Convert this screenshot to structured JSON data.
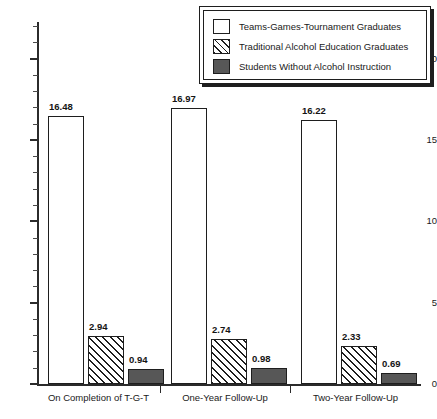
{
  "chart_data": {
    "type": "bar",
    "title": "",
    "subtitle": "",
    "xlabel": "",
    "ylabel": "",
    "ylim": [
      0,
      22
    ],
    "y_major_ticks": [
      0,
      5,
      10,
      15,
      20
    ],
    "y_tick_labels": [
      "0",
      "5",
      "10",
      "15",
      "20"
    ],
    "y_minor_tick_step": 1,
    "grid": false,
    "legend_position": "top-right",
    "categories": [
      "On Completion of T-G-T",
      "One-Year Follow-Up",
      "Two-Year Follow-Up"
    ],
    "series": [
      {
        "name": "Teams-Games-Tournament Graduates",
        "fill": "white",
        "color": "#ffffff",
        "values": [
          16.48,
          16.97,
          16.22
        ],
        "labels": [
          "16.48",
          "16.97",
          "16.22"
        ]
      },
      {
        "name": "Traditional Alcohol Education Graduates",
        "fill": "diagonal-hatch",
        "color": "#ffffff",
        "values": [
          2.94,
          2.74,
          2.33
        ],
        "labels": [
          "2.94",
          "2.74",
          "2.33"
        ]
      },
      {
        "name": "Students Without Alcohol Instruction",
        "fill": "solid-dark-gray",
        "color": "#575757",
        "values": [
          0.94,
          0.98,
          0.69
        ],
        "labels": [
          "0.94",
          "0.98",
          "0.69"
        ]
      }
    ]
  },
  "legend": {
    "items": [
      {
        "label": "Teams-Games-Tournament Graduates",
        "swatch": "white-swatch-icon"
      },
      {
        "label": "Traditional Alcohol Education Graduates",
        "swatch": "hatched-swatch-icon"
      },
      {
        "label": "Students Without Alcohol Instruction",
        "swatch": "dark-swatch-icon"
      }
    ]
  },
  "axes": {
    "y_ticks": [
      {
        "label": "20",
        "value": 20
      },
      {
        "label": "15",
        "value": 15
      },
      {
        "label": "10",
        "value": 10
      },
      {
        "label": "5",
        "value": 5
      },
      {
        "label": "0",
        "value": 0
      }
    ],
    "x_categories": [
      "On Completion of T-G-T",
      "One-Year Follow-Up",
      "Two-Year Follow-Up"
    ]
  },
  "colors": {
    "axis": "#2b2b2b",
    "bar_outline": "#1e1e1e",
    "series_white": "#ffffff",
    "series_hatch": "#ffffff",
    "series_dark": "#575757",
    "background": "#ffffff"
  }
}
